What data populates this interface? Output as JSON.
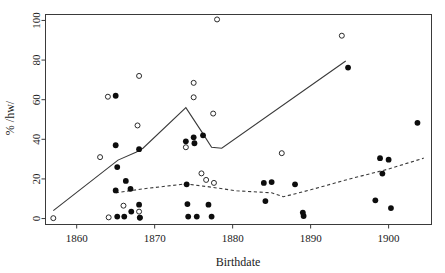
{
  "chart_data": {
    "type": "scatter",
    "title": "",
    "xlabel": "Birthdate",
    "ylabel": "% /hw/",
    "xlim": [
      1856.0,
      1905.5
    ],
    "ylim": [
      -3,
      103
    ],
    "xticks": [
      1860,
      1870,
      1880,
      1890,
      1900
    ],
    "xticklabels": [
      "1860",
      "1870",
      "1880",
      "1890",
      "1900"
    ],
    "yticks": [
      0,
      20,
      40,
      60,
      80,
      100
    ],
    "yticklabels": [
      "0",
      "20",
      "40",
      "60",
      "80",
      "100"
    ],
    "grid": false,
    "legend": "none",
    "series": [
      {
        "name": "open circles",
        "marker": "open-circle",
        "color": "#2b2b2b",
        "points": [
          [
            1857.0,
            0.2
          ],
          [
            1863.0,
            31.0
          ],
          [
            1864.0,
            61.5
          ],
          [
            1864.1,
            0.6
          ],
          [
            1866.0,
            6.5
          ],
          [
            1867.8,
            47.0
          ],
          [
            1868.0,
            72.0
          ],
          [
            1868.0,
            3.5
          ],
          [
            1868.1,
            0.4
          ],
          [
            1874.0,
            36.0
          ],
          [
            1875.0,
            68.5
          ],
          [
            1875.0,
            61.2
          ],
          [
            1876.0,
            22.8
          ],
          [
            1876.6,
            19.5
          ],
          [
            1877.5,
            53.0
          ],
          [
            1877.6,
            18.0
          ],
          [
            1878.0,
            100.5
          ],
          [
            1886.3,
            33.0
          ],
          [
            1894.0,
            92.3
          ]
        ]
      },
      {
        "name": "filled circles",
        "marker": "filled-circle",
        "color": "#0d0d0d",
        "points": [
          [
            1865.0,
            62.0
          ],
          [
            1865.0,
            37.0
          ],
          [
            1865.2,
            26.0
          ],
          [
            1865.0,
            14.2
          ],
          [
            1865.2,
            1.0
          ],
          [
            1866.1,
            1.0
          ],
          [
            1866.3,
            19.0
          ],
          [
            1866.9,
            15.0
          ],
          [
            1867.0,
            3.5
          ],
          [
            1868.0,
            35.0
          ],
          [
            1868.0,
            7.0
          ],
          [
            1868.1,
            0.5
          ],
          [
            1874.0,
            39.0
          ],
          [
            1874.1,
            17.3
          ],
          [
            1874.2,
            7.3
          ],
          [
            1874.3,
            1.0
          ],
          [
            1875.0,
            41.0
          ],
          [
            1875.1,
            38.0
          ],
          [
            1875.4,
            1.0
          ],
          [
            1876.2,
            42.0
          ],
          [
            1876.9,
            7.0
          ],
          [
            1877.3,
            1.0
          ],
          [
            1884.0,
            18.0
          ],
          [
            1884.2,
            8.8
          ],
          [
            1885.0,
            18.4
          ],
          [
            1888.0,
            17.3
          ],
          [
            1889.0,
            3.0
          ],
          [
            1889.1,
            1.3
          ],
          [
            1894.8,
            76.2
          ],
          [
            1898.3,
            9.2
          ],
          [
            1898.9,
            30.5
          ],
          [
            1899.2,
            22.7
          ],
          [
            1900.0,
            29.7
          ],
          [
            1900.3,
            5.3
          ],
          [
            1903.7,
            48.3
          ]
        ]
      }
    ],
    "trend_lines": [
      {
        "name": "solid-trend",
        "style": "solid",
        "color": "#3a3a3a",
        "points": [
          [
            1857.0,
            4.0
          ],
          [
            1865.3,
            29.5
          ],
          [
            1867.6,
            33.5
          ],
          [
            1868.5,
            35.5
          ],
          [
            1874.0,
            56.0
          ],
          [
            1876.0,
            44.0
          ],
          [
            1877.3,
            36.0
          ],
          [
            1878.6,
            35.5
          ],
          [
            1894.5,
            79.5
          ]
        ]
      },
      {
        "name": "dashed-trend",
        "style": "dashed",
        "color": "#3a3a3a",
        "points": [
          [
            1865.0,
            13.0
          ],
          [
            1868.5,
            15.0
          ],
          [
            1874.0,
            17.5
          ],
          [
            1877.0,
            16.0
          ],
          [
            1880.5,
            14.0
          ],
          [
            1885.0,
            13.0
          ],
          [
            1886.5,
            11.0
          ],
          [
            1890.0,
            14.5
          ],
          [
            1895.0,
            20.0
          ],
          [
            1900.0,
            25.0
          ],
          [
            1904.5,
            30.5
          ]
        ]
      }
    ]
  }
}
